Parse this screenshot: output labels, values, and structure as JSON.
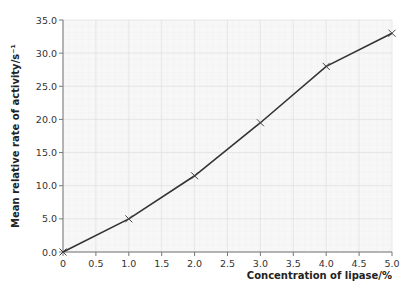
{
  "chart_data": {
    "type": "line",
    "title": "",
    "xlabel": "Concentration of lipase/%",
    "ylabel": "Mean relative rate of activity/s⁻¹",
    "x": [
      0,
      1.0,
      2.0,
      3.0,
      4.0,
      5.0
    ],
    "series": [
      {
        "name": "Mean relative rate of activity",
        "values": [
          0.0,
          5.0,
          11.5,
          19.5,
          28.0,
          33.0
        ],
        "marker": "x",
        "color": "#333333"
      }
    ],
    "xlim": [
      0,
      5.0
    ],
    "ylim": [
      0,
      35.0
    ],
    "xticks": [
      "0",
      "0.5",
      "1.0",
      "1.5",
      "2.0",
      "2.5",
      "3.0",
      "3.5",
      "4.0",
      "4.5",
      "5.0"
    ],
    "yticks": [
      "0.0",
      "5.0",
      "10.0",
      "15.0",
      "20.0",
      "25.0",
      "30.0",
      "35.0"
    ],
    "grid": true,
    "legend": false
  },
  "labels": {
    "xlabel": "Concentration of lipase/%",
    "ylabel": "Mean relative rate of activity/s⁻¹"
  }
}
